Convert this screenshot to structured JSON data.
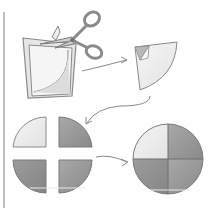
{
  "diagram": {
    "steps": [
      {
        "id": "step-1",
        "label": "Folded square cut with scissors along a curve"
      },
      {
        "id": "step-2",
        "label": "Unfolded quarter-circle piece with folded corner"
      },
      {
        "id": "step-3",
        "label": "Four separate quarter-circle pieces"
      },
      {
        "id": "step-4",
        "label": "Quarter pieces assembled into a full circle"
      }
    ],
    "icons": {
      "scissors": "scissors-icon",
      "arrow": "curved-arrow-icon"
    },
    "colors": {
      "outline": "#8a8a8a",
      "paper_light": "#f2f2f2",
      "paper_mid": "#d9d9d9",
      "quarter_light": "#ebebeb",
      "quarter_dark": "#9a9a9a",
      "quarter_darker": "#8c8c8c",
      "left_rule": "#a8a8a8"
    }
  }
}
